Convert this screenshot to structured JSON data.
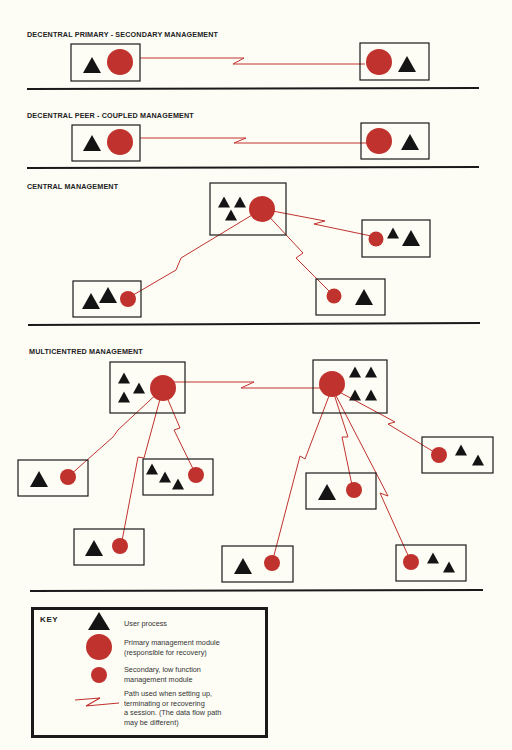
{
  "sections": [
    {
      "title": "DECENTRAL PRIMARY - SECONDARY MANAGEMENT"
    },
    {
      "title": "DECENTRAL PEER - COUPLED MANAGEMENT"
    },
    {
      "title": "CENTRAL MANAGEMENT"
    },
    {
      "title": "MULTICENTRED MANAGEMENT"
    }
  ],
  "key": {
    "title": "KEY",
    "items": [
      {
        "symbol": "triangle-icon",
        "label": "User process"
      },
      {
        "symbol": "large-circle-icon",
        "label_line1": "Primary management module",
        "label_line2": "(responsible for recovery)"
      },
      {
        "symbol": "small-circle-icon",
        "label_line1": "Secondary, low function",
        "label_line2": "management module"
      },
      {
        "symbol": "zigzag-path-icon",
        "label_line1": "Path used when setting up,",
        "label_line2": "terminating or recovering",
        "label_line3": "a session. (The data flow path",
        "label_line4": "may be different)"
      }
    ]
  },
  "colors": {
    "module_red": "#c0322e",
    "path_red": "#c0322e",
    "process_black": "#141414",
    "background": "#fdfdf6"
  }
}
